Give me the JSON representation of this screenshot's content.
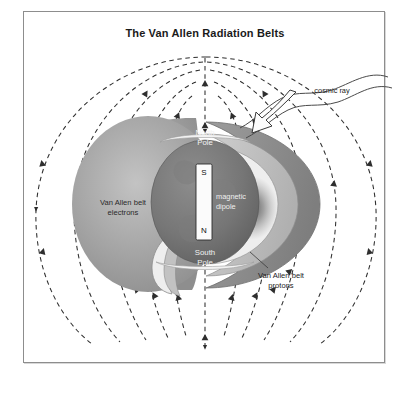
{
  "figure": {
    "title": "The Van Allen Radiation Belts",
    "border_color": "#8d8d8d",
    "background": "#ffffff"
  },
  "labels": {
    "north_pole_line1": "North",
    "north_pole_line2": "Pole",
    "south_pole_line1": "South",
    "south_pole_line2": "Pole",
    "dipole_line1": "magnetic",
    "dipole_line2": "dipole",
    "dipole_south_pole_mark": "S",
    "dipole_north_pole_mark": "N",
    "electrons_line1": "Van Allen belt",
    "electrons_line2": "electrons",
    "protons_line1": "Van Allen belt",
    "protons_line2": "protons",
    "cosmic_ray": "cosmic ray"
  },
  "icons": {
    "field_line": "dashed-field-line-icon",
    "field_arrow": "field-arrowhead-icon",
    "cosmic_ray_arrow": "cosmic-ray-arrow-icon",
    "cosmic_ray_wave": "cosmic-ray-wave-icon",
    "dipole_bar": "magnetic-dipole-bar-icon",
    "earth_globe": "earth-globe-icon",
    "belt_crescent": "radiation-belt-crescent-icon"
  },
  "colors": {
    "field_line": "#2e2e2e",
    "earth_dark": "#6f6f6f",
    "earth_mid": "#8f8f8f",
    "belt_dark": "#8a8a8a",
    "belt_mid": "#b4b4b4",
    "belt_light": "#d2d2d2",
    "belt_white": "#f4f4f4",
    "electron_cloud": "#9a9a9a",
    "outline": "#3a3a3a",
    "text": "#1c1c1c",
    "text_light": "#f2f2f2"
  }
}
